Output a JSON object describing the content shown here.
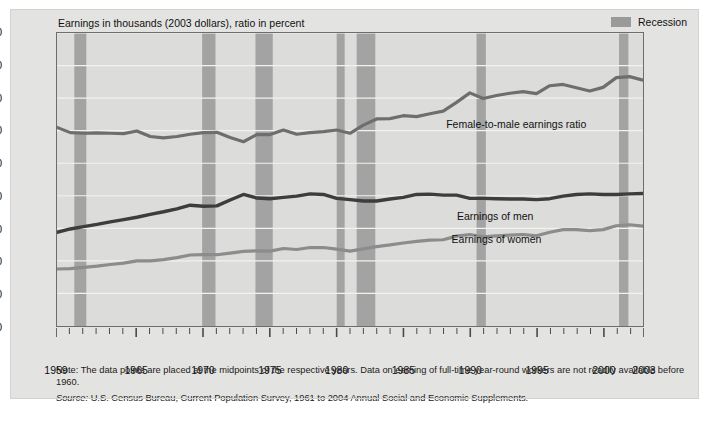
{
  "subtitle": "Earnings in thousands (2003 dollars), ratio in percent",
  "legend": {
    "label": "Recession",
    "swatch_color": "#9a9a9a"
  },
  "axis": {
    "ylabel": "Median Annual Earnings, 1998 Dollars (thousands)",
    "yticks": [
      "0",
      "10",
      "20",
      "30",
      "40",
      "50",
      "60",
      "70",
      "80",
      "90"
    ],
    "xticks": [
      "1959",
      "1965",
      "1970",
      "1975",
      "1980",
      "1985",
      "1990",
      "1995",
      "2000",
      "2003"
    ]
  },
  "annotations": {
    "ratio": "Female-to-male earnings ratio",
    "men": "Earnings of men",
    "women": "Earnings of women"
  },
  "notes": {
    "note": "Note: The data points are placed at the midpoints of the respective years. Data on earning of full-time year-round workers are not readily available before 1960.",
    "source_label": "Source:",
    "source_text": "U.S. Census Bureau, Current Population Survey, 1961 to 2004 Annual Social and Economic Supplements."
  },
  "colors": {
    "men_line": "#3d3d3d",
    "women_line": "#8c8c8c",
    "ratio_line": "#6e6e6e",
    "recession_band": "#a3a3a3",
    "plot_bg": "#dcdcda",
    "figure_bg": "#e3e3e1"
  },
  "chart_data": {
    "type": "line",
    "title": "",
    "subtitle": "Earnings in thousands (2003 dollars), ratio in percent",
    "xlabel": "",
    "ylabel": "Median Annual Earnings, 1998 Dollars (thousands)",
    "xlim": [
      1959,
      2003
    ],
    "ylim": [
      0,
      90
    ],
    "grid": true,
    "legend_position": "in-plot annotations",
    "x": [
      1959,
      1960,
      1961,
      1962,
      1963,
      1964,
      1965,
      1966,
      1967,
      1968,
      1969,
      1970,
      1971,
      1972,
      1973,
      1974,
      1975,
      1976,
      1977,
      1978,
      1979,
      1980,
      1981,
      1982,
      1983,
      1984,
      1985,
      1986,
      1987,
      1988,
      1989,
      1990,
      1991,
      1992,
      1993,
      1994,
      1995,
      1996,
      1997,
      1998,
      1999,
      2000,
      2001,
      2002,
      2003
    ],
    "series": [
      {
        "name": "Female-to-male earnings ratio",
        "units": "percent",
        "values": [
          61.0,
          59.4,
          59.2,
          59.3,
          59.2,
          59.1,
          59.9,
          58.2,
          57.8,
          58.2,
          58.9,
          59.4,
          59.5,
          57.9,
          56.6,
          58.8,
          58.8,
          60.2,
          58.9,
          59.4,
          59.7,
          60.2,
          59.2,
          61.7,
          63.6,
          63.7,
          64.6,
          64.3,
          65.2,
          66.0,
          68.7,
          71.6,
          69.9,
          70.8,
          71.5,
          72.0,
          71.4,
          73.8,
          74.2,
          73.2,
          72.2,
          73.3,
          76.3,
          76.6,
          75.5
        ]
      },
      {
        "name": "Earnings of men",
        "units": "thousands of 2003 dollars",
        "values": [
          28.8,
          29.8,
          30.5,
          31.2,
          32.0,
          32.7,
          33.4,
          34.3,
          35.1,
          36.0,
          37.1,
          36.8,
          36.9,
          38.7,
          40.4,
          39.3,
          39.1,
          39.5,
          39.9,
          40.6,
          40.4,
          39.2,
          38.8,
          38.4,
          38.4,
          39.0,
          39.5,
          40.4,
          40.5,
          40.2,
          40.2,
          39.2,
          39.2,
          39.1,
          39.0,
          39.0,
          38.8,
          39.1,
          39.9,
          40.4,
          40.6,
          40.4,
          40.4,
          40.6,
          40.7
        ]
      },
      {
        "name": "Earnings of women",
        "units": "thousands of 2003 dollars",
        "values": [
          17.5,
          17.6,
          18.0,
          18.4,
          18.9,
          19.3,
          20.0,
          20.0,
          20.4,
          21.0,
          21.8,
          21.9,
          21.9,
          22.4,
          22.9,
          23.1,
          23.0,
          23.8,
          23.5,
          24.1,
          24.1,
          23.6,
          23.0,
          23.7,
          24.4,
          24.9,
          25.5,
          26.0,
          26.4,
          26.5,
          27.6,
          28.1,
          27.4,
          27.7,
          27.9,
          28.1,
          27.7,
          28.8,
          29.6,
          29.6,
          29.3,
          29.6,
          30.8,
          31.1,
          30.7
        ]
      }
    ],
    "recessions": [
      {
        "start": 1960.3,
        "end": 1961.2
      },
      {
        "start": 1969.9,
        "end": 1970.9
      },
      {
        "start": 1973.9,
        "end": 1975.2
      },
      {
        "start": 1980.0,
        "end": 1980.6
      },
      {
        "start": 1981.5,
        "end": 1982.9
      },
      {
        "start": 1990.5,
        "end": 1991.2
      },
      {
        "start": 2001.2,
        "end": 2001.9
      }
    ]
  }
}
